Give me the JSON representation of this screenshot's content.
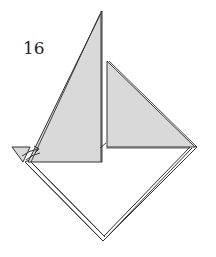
{
  "diagram": {
    "step_number": "16",
    "colors": {
      "paper_colored": "#d9d9d9",
      "paper_white": "#ffffff",
      "line": "#333333"
    },
    "elements": [
      {
        "name": "left-sail",
        "shape": "triangle",
        "fill": "colored"
      },
      {
        "name": "right-sail",
        "shape": "triangle",
        "fill": "colored"
      },
      {
        "name": "hull-diamond",
        "shape": "diamond",
        "fill": "white"
      },
      {
        "name": "fold-arrow",
        "shape": "arrow"
      }
    ]
  }
}
